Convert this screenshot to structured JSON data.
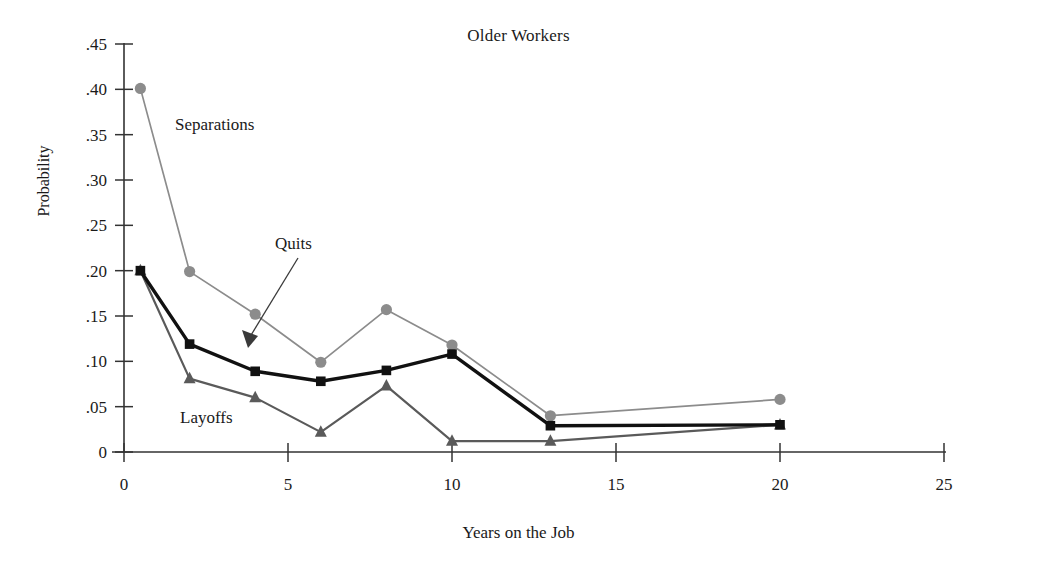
{
  "chart_data": {
    "type": "line",
    "title": "Older Workers",
    "xlabel": "Years on the Job",
    "ylabel": "Probability",
    "x": [
      0.5,
      2,
      4,
      6,
      8,
      10,
      13,
      20
    ],
    "xlim": [
      0,
      25
    ],
    "ylim": [
      0,
      0.45
    ],
    "grid": false,
    "legend_position": "inline-annotations",
    "xticks": [
      "0",
      "5",
      "10",
      "15",
      "20",
      "25"
    ],
    "xtick_values": [
      0,
      5,
      10,
      15,
      20,
      25
    ],
    "yticks": [
      "0",
      ".05",
      ".10",
      ".15",
      ".20",
      ".25",
      ".30",
      ".35",
      ".40",
      ".45"
    ],
    "ytick_values": [
      0,
      0.05,
      0.1,
      0.15,
      0.2,
      0.25,
      0.3,
      0.35,
      0.4,
      0.45
    ],
    "series": [
      {
        "name": "Separations",
        "marker": "circle",
        "color": "#8c8c8c",
        "values": [
          0.401,
          0.199,
          0.152,
          0.099,
          0.157,
          0.118,
          0.04,
          0.058
        ]
      },
      {
        "name": "Quits",
        "marker": "square",
        "color": "#111111",
        "values": [
          0.2,
          0.119,
          0.089,
          0.078,
          0.09,
          0.108,
          0.029,
          0.03
        ]
      },
      {
        "name": "Layoffs",
        "marker": "triangle",
        "color": "#5a5a5a",
        "values": [
          0.2,
          0.081,
          0.06,
          0.022,
          0.073,
          0.012,
          0.012,
          0.03
        ]
      }
    ],
    "annotations": [
      {
        "text": "Separations",
        "series": "Separations"
      },
      {
        "text": "Quits",
        "series": "Quits",
        "arrow": true
      },
      {
        "text": "Layoffs",
        "series": "Layoffs"
      }
    ],
    "axis_color": "#333333"
  }
}
